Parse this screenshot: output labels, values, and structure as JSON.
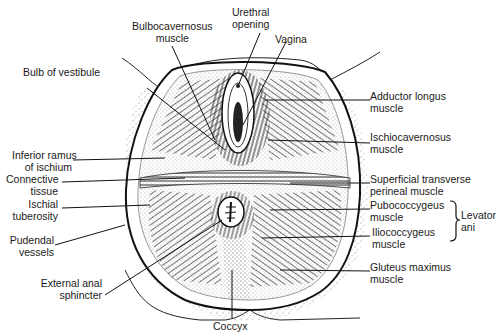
{
  "diagram": {
    "type": "anatomical-illustration",
    "labels_left": [
      {
        "id": "bulb-of-vestibule",
        "line1": "Bulb of vestibule",
        "line2": ""
      },
      {
        "id": "inferior-ramus-of-ischium",
        "line1": "Inferior ramus",
        "line2": "of ischium"
      },
      {
        "id": "connective-tissue",
        "line1": "Connective",
        "line2": "tissue"
      },
      {
        "id": "ischial-tuberosity",
        "line1": "Ischial",
        "line2": "tuberosity"
      },
      {
        "id": "pudendal-vessels",
        "line1": "Pudendal",
        "line2": "vessels"
      },
      {
        "id": "external-anal-sphincter",
        "line1": "External anal",
        "line2": "sphincter"
      }
    ],
    "labels_top": [
      {
        "id": "bulbocavernosus-muscle",
        "line1": "Bulbocavernosus",
        "line2": "muscle"
      },
      {
        "id": "urethral-opening",
        "line1": "Urethral",
        "line2": "opening"
      },
      {
        "id": "vagina",
        "line1": "Vagina",
        "line2": ""
      }
    ],
    "labels_right": [
      {
        "id": "adductor-longus-muscle",
        "line1": "Adductor longus",
        "line2": "muscle"
      },
      {
        "id": "ischiocavernosus-muscle",
        "line1": "Ischiocavernosus",
        "line2": "muscle"
      },
      {
        "id": "superficial-transverse-perineal-muscle",
        "line1": "Superficial transverse",
        "line2": "perineal muscle"
      },
      {
        "id": "pubococcygeus-muscle",
        "line1": "Pubococcygeus",
        "line2": "muscle"
      },
      {
        "id": "iliococcygeus-muscle",
        "line1": "Iliococcygeus",
        "line2": "muscle"
      },
      {
        "id": "gluteus-maximus-muscle",
        "line1": "Gluteus maximus",
        "line2": "muscle"
      }
    ],
    "labels_bottom": [
      {
        "id": "coccyx",
        "line1": "Coccyx"
      }
    ],
    "group_bracket": {
      "line1": "Levator",
      "line2": "ani",
      "groups": [
        "pubococcygeus-muscle",
        "iliococcygeus-muscle"
      ]
    }
  }
}
